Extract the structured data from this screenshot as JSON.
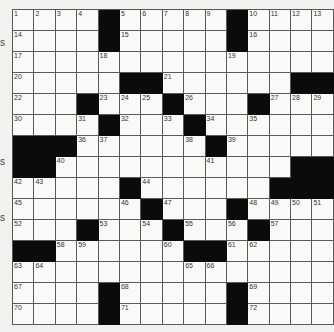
{
  "puzzle": {
    "rows": 15,
    "cols": 15,
    "grid": [
      [
        "1",
        "2",
        "3",
        "4",
        "#",
        "5",
        "6",
        "7",
        "8",
        "9",
        "#",
        "10",
        "11",
        "12",
        "13"
      ],
      [
        "14",
        "",
        "",
        "",
        "#",
        "15",
        "",
        "",
        "",
        "",
        "#",
        "16",
        "",
        "",
        ""
      ],
      [
        "17",
        "",
        "",
        "",
        "18",
        "",
        "",
        "",
        "",
        "",
        "19",
        "",
        "",
        "",
        ""
      ],
      [
        "20",
        "",
        "",
        "",
        "",
        "#",
        "#",
        "21",
        "",
        "",
        "",
        "",
        "",
        "#",
        "#"
      ],
      [
        "22",
        "",
        "",
        "#",
        "23",
        "24",
        "25",
        "#",
        "26",
        "",
        "",
        "#",
        "27",
        "28",
        "29"
      ],
      [
        "30",
        "",
        "",
        "31",
        "#",
        "32",
        "",
        "33",
        "#",
        "34",
        "",
        "35",
        "",
        "",
        ""
      ],
      [
        "#",
        "#",
        "#",
        "36",
        "37",
        "",
        "",
        "",
        "38",
        "#",
        "39",
        "",
        "",
        "",
        ""
      ],
      [
        "#",
        "#",
        "40",
        "",
        "",
        "",
        "",
        "",
        "",
        "41",
        "",
        "",
        "",
        "#",
        "#"
      ],
      [
        "42",
        "43",
        "",
        "",
        "",
        "#",
        "44",
        "",
        "",
        "",
        "",
        "",
        "#",
        "#",
        "#"
      ],
      [
        "45",
        "",
        "",
        "",
        "",
        "46",
        "#",
        "47",
        "",
        "",
        "#",
        "48",
        "49",
        "50",
        "51"
      ],
      [
        "52",
        "",
        "",
        "#",
        "53",
        "",
        "54",
        "#",
        "55",
        "",
        "56",
        "#",
        "57",
        "",
        ""
      ],
      [
        "#",
        "#",
        "58",
        "59",
        "",
        "",
        "",
        "60",
        "#",
        "#",
        "61",
        "62",
        "",
        "",
        ""
      ],
      [
        "63",
        "64",
        "",
        "",
        "",
        "",
        "",
        "",
        "65",
        "66",
        "",
        "",
        "",
        "",
        ""
      ],
      [
        "67",
        "",
        "",
        "",
        "#",
        "68",
        "",
        "",
        "",
        "",
        "#",
        "69",
        "",
        "",
        ""
      ],
      [
        "70",
        "",
        "",
        "",
        "#",
        "71",
        "",
        "",
        "",
        "",
        "#",
        "72",
        "",
        "",
        ""
      ]
    ],
    "entries": {}
  },
  "left_margin_fragments": [
    {
      "text": "s"
    },
    {
      "text": "s"
    },
    {
      "text": "s"
    }
  ]
}
